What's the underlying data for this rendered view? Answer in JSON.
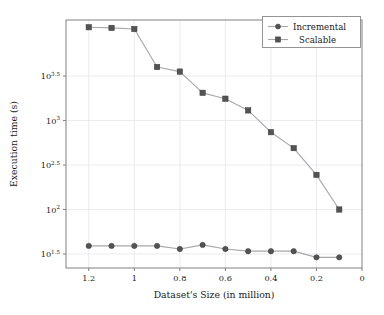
{
  "chart_data": {
    "type": "line",
    "title": "",
    "xlabel": "Dataset's Size (in million)",
    "ylabel": "Execution time (s)",
    "x": [
      1.2,
      1.1,
      1.0,
      0.9,
      0.8,
      0.7,
      0.6,
      0.5,
      0.4,
      0.3,
      0.2,
      0.1
    ],
    "xlim": [
      1.3,
      0
    ],
    "x_reversed": true,
    "x_tick_labels": [
      "1.2",
      "1",
      "0.8",
      "0.6",
      "0.4",
      "0.2",
      "0"
    ],
    "x_tick_values": [
      1.2,
      1.0,
      0.8,
      0.6,
      0.4,
      0.2,
      0.0
    ],
    "yscale": "log",
    "ylim": [
      22,
      13500
    ],
    "y_tick_labels": [
      "10^{3.5}",
      "10^{3}",
      "10^{2.5}",
      "10^{2}",
      "10^{1.5}"
    ],
    "y_tick_bases": [
      "10",
      "10",
      "10",
      "10",
      "10"
    ],
    "y_tick_exponents": [
      "3.5",
      "3",
      "2.5",
      "2",
      "1.5"
    ],
    "y_tick_values": [
      3162.28,
      1000,
      316.23,
      100,
      31.62
    ],
    "grid": true,
    "legend_position": "top-right",
    "series": [
      {
        "name": "Incremental",
        "marker": "circle",
        "values": [
          39,
          39,
          39,
          39,
          36,
          40,
          36,
          34,
          34,
          34,
          29,
          29
        ]
      },
      {
        "name": "Scalable",
        "marker": "square",
        "values": [
          11200,
          11000,
          10700,
          4000,
          3550,
          2050,
          1760,
          1300,
          740,
          490,
          245,
          100
        ]
      }
    ]
  },
  "legend": {
    "entries": [
      {
        "label": "Incremental",
        "marker": "circle"
      },
      {
        "label": "Scalable",
        "marker": "square"
      }
    ]
  },
  "colors": {
    "marker": "#535353",
    "line": "#a8a8a8",
    "grid": "#e9e9ee",
    "axis": "#808080",
    "background": "#ffffff",
    "text": "#1a1a1a"
  }
}
